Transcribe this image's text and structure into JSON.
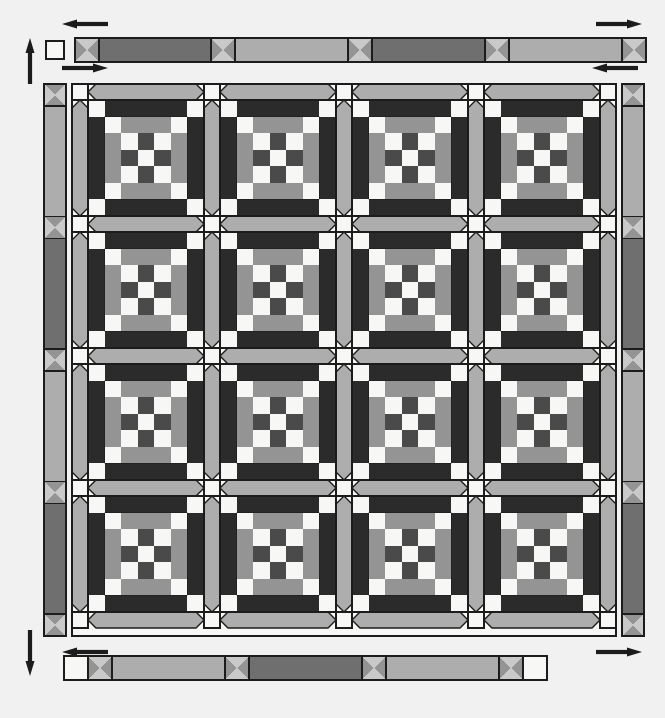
{
  "document": {
    "kind": "quilt-layout-diagram",
    "caption_fragment": "",
    "width": 665,
    "height": 718
  },
  "palette": {
    "background": "#f1f1f1",
    "outline": "#1c1c1c",
    "white": "#f7f7f5",
    "light": "#c9c9c9",
    "medium_light": "#adadad",
    "medium": "#949494",
    "medium_dark": "#6f6f6f",
    "dark": "#4a4a4a",
    "very_dark": "#2b2b2b",
    "near_black": "#1f1f1f"
  },
  "layout": {
    "blocks_across": 4,
    "blocks_down": 4,
    "block_grid": 7,
    "sashing_width": 16,
    "cornerstone_label": "white square",
    "inner_border_label": "narrow strip with triangle squares",
    "outer_border_label": "pieced border strip"
  },
  "arrows": [
    {
      "name": "arrow-top-left-outer",
      "direction": "left",
      "x": 62,
      "y": 24
    },
    {
      "name": "arrow-left-up",
      "direction": "up",
      "x": 30,
      "y": 38
    },
    {
      "name": "arrow-top-left-inner",
      "direction": "right",
      "x": 62,
      "y": 68
    },
    {
      "name": "arrow-top-right-outer",
      "direction": "right",
      "x": 596,
      "y": 24
    },
    {
      "name": "arrow-top-right-inner",
      "direction": "left",
      "x": 592,
      "y": 68
    },
    {
      "name": "arrow-bottom-left-down",
      "direction": "down",
      "x": 30,
      "y": 630
    },
    {
      "name": "arrow-bottom-left-in",
      "direction": "left",
      "x": 62,
      "y": 652
    },
    {
      "name": "arrow-bottom-right-in",
      "direction": "right",
      "x": 596,
      "y": 652
    }
  ],
  "border_strips": {
    "top": {
      "name": "top-outer-border-strip",
      "x": 75,
      "y": 38,
      "w": 545,
      "h": 24,
      "segments": [
        {
          "type": "triangle-square",
          "shade": "medium"
        },
        {
          "type": "strip",
          "shade": "medium_dark",
          "len": 112
        },
        {
          "type": "triangle-square",
          "shade": "medium"
        },
        {
          "type": "strip",
          "shade": "medium_light",
          "len": 113
        },
        {
          "type": "triangle-square",
          "shade": "medium"
        },
        {
          "type": "strip",
          "shade": "medium_dark",
          "len": 113
        },
        {
          "type": "triangle-square",
          "shade": "medium"
        },
        {
          "type": "strip",
          "shade": "medium_light",
          "len": 113
        },
        {
          "type": "triangle-square",
          "shade": "medium"
        }
      ]
    },
    "bottom": {
      "name": "bottom-outer-border-strip",
      "x": 64,
      "y": 656,
      "w": 545,
      "h": 24,
      "segments": [
        {
          "type": "white-square"
        },
        {
          "type": "triangle-square",
          "shade": "medium"
        },
        {
          "type": "strip",
          "shade": "medium_light",
          "len": 113
        },
        {
          "type": "triangle-square",
          "shade": "medium"
        },
        {
          "type": "strip",
          "shade": "medium_dark",
          "len": 113
        },
        {
          "type": "triangle-square",
          "shade": "medium"
        },
        {
          "type": "strip",
          "shade": "medium_light",
          "len": 113
        },
        {
          "type": "triangle-square",
          "shade": "medium"
        },
        {
          "type": "white-square"
        }
      ]
    },
    "left": {
      "name": "left-inner-border-strip",
      "x": 44,
      "y": 84,
      "w": 22,
      "h": 552
    },
    "right": {
      "name": "right-inner-border-strip",
      "x": 622,
      "y": 84,
      "w": 22,
      "h": 552
    }
  },
  "corner_squares": [
    {
      "name": "corner-square-top-left",
      "x": 46,
      "y": 41,
      "size": 18
    },
    {
      "name": "corner-square-top-right",
      "x": 622,
      "y": 41,
      "size": 18
    }
  ],
  "quilt": {
    "name": "quilt-top-grid",
    "x": 72,
    "y": 84,
    "w": 544,
    "h": 552
  },
  "block": {
    "name": "nine-patch-chain-block",
    "rows": [
      [
        "very_dark",
        "very_dark",
        "very_dark",
        "very_dark",
        "very_dark",
        "very_dark",
        "very_dark"
      ],
      [
        "very_dark",
        "white",
        "medium",
        "medium",
        "medium",
        "white",
        "very_dark"
      ],
      [
        "very_dark",
        "medium",
        "white",
        "dark",
        "white",
        "medium",
        "very_dark"
      ],
      [
        "very_dark",
        "medium",
        "dark",
        "white",
        "dark",
        "medium",
        "very_dark"
      ],
      [
        "very_dark",
        "medium",
        "white",
        "dark",
        "white",
        "medium",
        "very_dark"
      ],
      [
        "very_dark",
        "white",
        "medium",
        "medium",
        "medium",
        "white",
        "very_dark"
      ],
      [
        "very_dark",
        "very_dark",
        "very_dark",
        "very_dark",
        "very_dark",
        "very_dark",
        "very_dark"
      ]
    ],
    "corner_accent": "white",
    "side_accent": "dark"
  }
}
